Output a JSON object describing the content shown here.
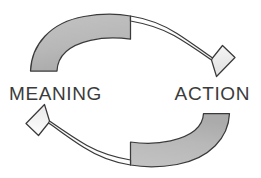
{
  "diagram": {
    "type": "cycle-diagram",
    "background_color": "#ffffff",
    "labels": {
      "left": "MEANING",
      "right": "ACTION"
    },
    "label_color": "#3b3b3b",
    "arrows": [
      {
        "name": "top-arrow",
        "direction": "left-to-right",
        "from": "MEANING",
        "to": "ACTION",
        "tail_fill": "#b9b9b9",
        "head_fill": "#fbfbfb",
        "outline_color": "#3a3a3a"
      },
      {
        "name": "bottom-arrow",
        "direction": "right-to-left",
        "from": "ACTION",
        "to": "MEANING",
        "tail_fill": "#b9b9b9",
        "head_fill": "#fbfbfb",
        "outline_color": "#3a3a3a"
      }
    ]
  }
}
